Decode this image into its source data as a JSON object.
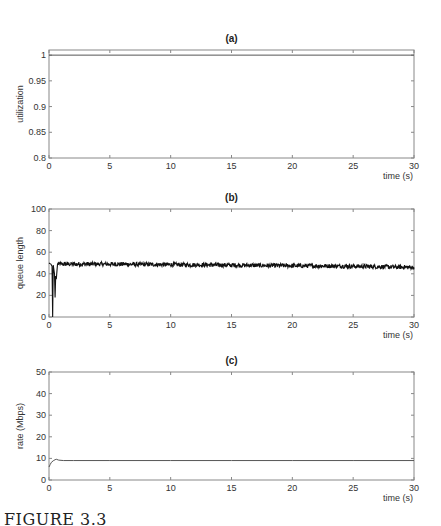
{
  "figure": {
    "caption": "FIGURE 3.3",
    "colors": {
      "axis": "#888888",
      "line": "#111111",
      "series_light": "#555555",
      "background": "#ffffff"
    }
  },
  "chart_data": [
    {
      "id": "a",
      "type": "line",
      "title": "(a)",
      "xlabel": "time (s)",
      "ylabel": "utilization",
      "xlim": [
        0,
        30
      ],
      "ylim": [
        0.8,
        1.01
      ],
      "xticks": [
        0,
        5,
        10,
        15,
        20,
        25,
        30
      ],
      "yticks": [
        0.8,
        0.85,
        0.9,
        0.95,
        1
      ],
      "ytick_labels": [
        "0.8",
        "0.85",
        "0.9",
        "0.95",
        "1"
      ],
      "grid": false,
      "series": [
        {
          "name": "utilization",
          "x": [
            0,
            30
          ],
          "y": [
            1.0,
            1.0
          ]
        }
      ]
    },
    {
      "id": "b",
      "type": "line",
      "title": "(b)",
      "xlabel": "time (s)",
      "ylabel": "queue length",
      "xlim": [
        0,
        30
      ],
      "ylim": [
        0,
        100
      ],
      "xticks": [
        0,
        5,
        10,
        15,
        20,
        25,
        30
      ],
      "yticks": [
        0,
        20,
        40,
        60,
        80,
        100
      ],
      "ytick_labels": [
        "0",
        "20",
        "40",
        "60",
        "80",
        "100"
      ],
      "grid": false,
      "noise_amplitude": 2,
      "series": [
        {
          "name": "queue length",
          "x": [
            0,
            0.15,
            0.25,
            0.3,
            0.35,
            0.45,
            0.5,
            0.55,
            0.6,
            0.7,
            1,
            2,
            5,
            10,
            15,
            20,
            25,
            30
          ],
          "y": [
            50,
            49,
            47,
            0,
            48,
            40,
            18,
            38,
            35,
            49,
            49,
            49,
            49,
            48.5,
            48,
            47.5,
            47,
            46
          ]
        }
      ]
    },
    {
      "id": "c",
      "type": "line",
      "title": "(c)",
      "xlabel": "time (s)",
      "ylabel": "rate (Mbps)",
      "xlim": [
        0,
        30
      ],
      "ylim": [
        0,
        50
      ],
      "xticks": [
        0,
        5,
        10,
        15,
        20,
        25,
        30
      ],
      "yticks": [
        0,
        10,
        20,
        30,
        40,
        50
      ],
      "ytick_labels": [
        "0",
        "10",
        "20",
        "30",
        "40",
        "50"
      ],
      "grid": false,
      "series": [
        {
          "name": "rate",
          "x": [
            0,
            0.1,
            0.2,
            0.35,
            0.5,
            0.6,
            0.8,
            1.2,
            2,
            5,
            10,
            15,
            20,
            25,
            30
          ],
          "y": [
            6,
            7.2,
            8.2,
            8.9,
            9.4,
            9.6,
            9.2,
            9.0,
            9.0,
            9.0,
            9.0,
            9.0,
            9.0,
            9.0,
            9.0
          ]
        }
      ]
    }
  ]
}
